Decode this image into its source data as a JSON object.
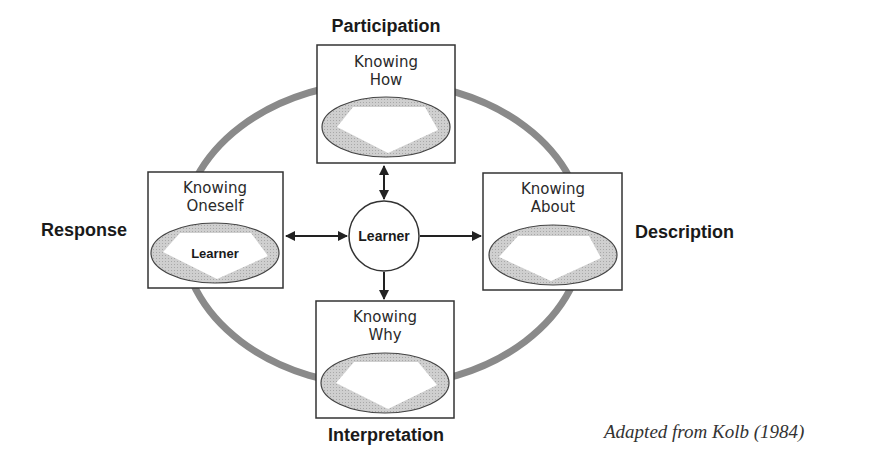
{
  "diagram": {
    "poles": {
      "top": "Participation",
      "left": "Response",
      "right": "Description",
      "bottom": "Interpretation"
    },
    "boxes": {
      "top": {
        "line1": "Knowing",
        "line2": "How"
      },
      "left": {
        "line1": "Knowing",
        "line2": "Oneself",
        "inner_label": "Learner"
      },
      "right": {
        "line1": "Knowing",
        "line2": "About"
      },
      "bottom": {
        "line1": "Knowing",
        "line2": "Why"
      }
    },
    "center": {
      "label": "Learner"
    },
    "arrows": [
      {
        "from": "center",
        "to": "top",
        "type": "double"
      },
      {
        "from": "center",
        "to": "left",
        "type": "double"
      },
      {
        "from": "center",
        "to": "right",
        "type": "single"
      },
      {
        "from": "center",
        "to": "bottom",
        "type": "single"
      }
    ],
    "colors": {
      "ring": "#8a8a8a",
      "oval_fill": "#c8c8c8",
      "stroke": "#333333"
    }
  },
  "citation": "Adapted from Kolb (1984)"
}
